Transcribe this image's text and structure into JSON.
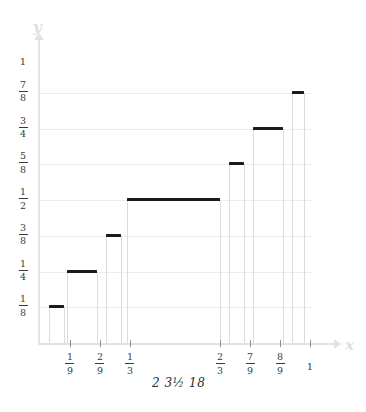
{
  "chart_data": {
    "type": "bar",
    "title": "",
    "subtitle": "",
    "xlabel": "x",
    "ylabel": "y",
    "xlim": [
      0,
      1
    ],
    "ylim": [
      0,
      1
    ],
    "grid": true,
    "legend": null,
    "caption": "2 3½ 18",
    "y_ticks": [
      {
        "label": "1",
        "num": "1",
        "den": "",
        "value": 1.0
      },
      {
        "label": "7/8",
        "num": "7",
        "den": "8",
        "value": 0.875
      },
      {
        "label": "3/4",
        "num": "3",
        "den": "4",
        "value": 0.75
      },
      {
        "label": "5/8",
        "num": "5",
        "den": "8",
        "value": 0.625
      },
      {
        "label": "1/2",
        "num": "1",
        "den": "2",
        "value": 0.5
      },
      {
        "label": "3/8",
        "num": "3",
        "den": "8",
        "value": 0.375
      },
      {
        "label": "1/4",
        "num": "1",
        "den": "4",
        "value": 0.25
      },
      {
        "label": "1/8",
        "num": "1",
        "den": "8",
        "value": 0.125
      }
    ],
    "x_ticks": [
      {
        "label": "1/9",
        "num": "1",
        "den": "9",
        "value": 0.1111
      },
      {
        "label": "2/9",
        "num": "2",
        "den": "9",
        "value": 0.2222
      },
      {
        "label": "1/3",
        "num": "1",
        "den": "3",
        "value": 0.3333
      },
      {
        "label": "2/3",
        "num": "2",
        "den": "3",
        "value": 0.6667
      },
      {
        "label": "7/9",
        "num": "7",
        "den": "9",
        "value": 0.7778
      },
      {
        "label": "8/9",
        "num": "8",
        "den": "9",
        "value": 0.8889
      },
      {
        "label": "1",
        "num": "1",
        "den": "",
        "value": 1.0
      }
    ],
    "steps": [
      {
        "name": "step-1-8",
        "y": 0.125,
        "x0": 0.0333,
        "x1": 0.0889
      },
      {
        "name": "step-1-4",
        "y": 0.25,
        "x0": 0.1,
        "x1": 0.2111
      },
      {
        "name": "step-3-8",
        "y": 0.375,
        "x0": 0.2444,
        "x1": 0.3
      },
      {
        "name": "step-1-2",
        "y": 0.5,
        "x0": 0.3222,
        "x1": 0.6667
      },
      {
        "name": "step-5-8",
        "y": 0.625,
        "x0": 0.7,
        "x1": 0.7556
      },
      {
        "name": "step-3-4",
        "y": 0.75,
        "x0": 0.7889,
        "x1": 0.9
      },
      {
        "name": "step-7-8",
        "y": 0.875,
        "x0": 0.9333,
        "x1": 0.9778
      }
    ]
  }
}
